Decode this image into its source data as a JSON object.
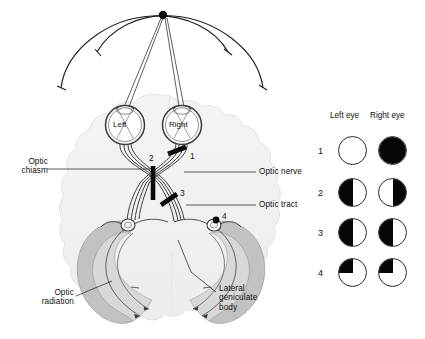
{
  "figure": {
    "background_color": "#ffffff",
    "line_color": "#2a2a2a",
    "brain_fill": "#f2f2f2",
    "radiation_fill": "#b9b9b9",
    "lesion_color": "#0a0a0a"
  },
  "stimulus": {
    "fixation_dot_label": "",
    "arc_count": 2
  },
  "eyes": {
    "left_label": "Left",
    "right_label": "Right"
  },
  "anatomy_labels": {
    "optic_chiasm": "Optic\nchiasm",
    "optic_nerve": "Optic nerve",
    "optic_tract": "Optic tract",
    "optic_radiation": "Optic\nradiation",
    "lateral_geniculate_body": "Lateral\ngeniculate\nbody"
  },
  "lesions": [
    {
      "id": "1",
      "label": "1",
      "site": "optic-nerve-right",
      "marker": "bar"
    },
    {
      "id": "2",
      "label": "2",
      "site": "optic-chiasm",
      "marker": "bar"
    },
    {
      "id": "3",
      "label": "3",
      "site": "optic-tract-right",
      "marker": "bar"
    },
    {
      "id": "4",
      "label": "4",
      "site": "optic-radiation-right",
      "marker": "dot"
    }
  ],
  "field_chart": {
    "column_headers": [
      "Left eye",
      "Right eye"
    ],
    "rows": [
      {
        "number": "1",
        "defect_name": "Total loss right eye",
        "left_eye": {
          "pattern": "none"
        },
        "right_eye": {
          "pattern": "full"
        }
      },
      {
        "number": "2",
        "defect_name": "Bitemporal hemianopia",
        "left_eye": {
          "pattern": "left-half"
        },
        "right_eye": {
          "pattern": "right-half"
        }
      },
      {
        "number": "3",
        "defect_name": "Left homonymous hemianopia",
        "left_eye": {
          "pattern": "left-half"
        },
        "right_eye": {
          "pattern": "left-half"
        }
      },
      {
        "number": "4",
        "defect_name": "Left upper quadrantanopia",
        "left_eye": {
          "pattern": "upper-left-quadrant"
        },
        "right_eye": {
          "pattern": "upper-left-quadrant"
        }
      }
    ]
  }
}
